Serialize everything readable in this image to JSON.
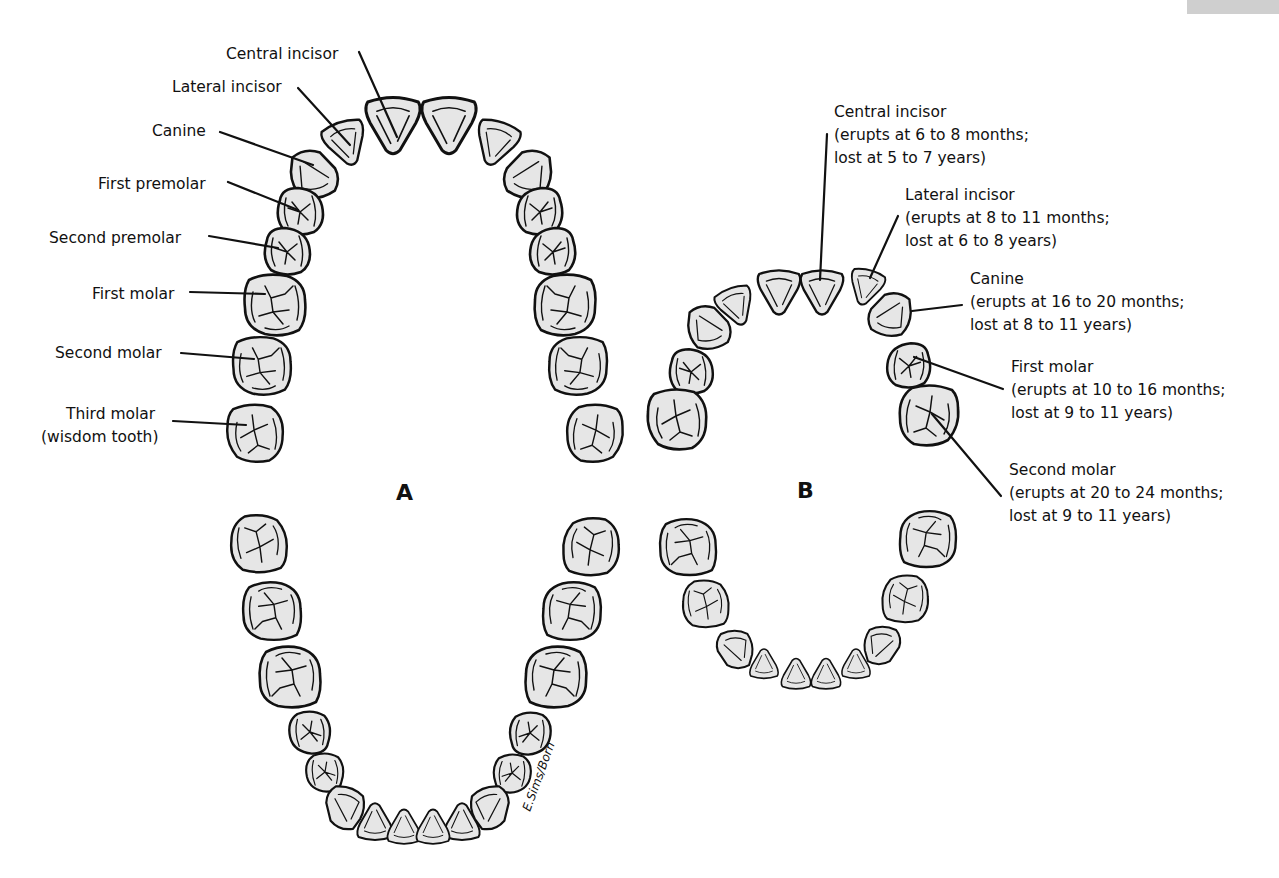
{
  "figure": {
    "panel_a_label": "A",
    "panel_b_label": "B",
    "signature": "E.Sims/Born",
    "colors": {
      "tooth_fill": "#e6e6e6",
      "outline": "#111111",
      "background": "#ffffff"
    }
  },
  "panel_a": {
    "title": "Permanent teeth",
    "labels": [
      {
        "name": "Central incisor"
      },
      {
        "name": "Lateral incisor"
      },
      {
        "name": "Canine"
      },
      {
        "name": "First premolar"
      },
      {
        "name": "Second premolar"
      },
      {
        "name": "First molar"
      },
      {
        "name": "Second molar"
      },
      {
        "name": "Third molar",
        "note": "(wisdom tooth)"
      }
    ]
  },
  "panel_b": {
    "title": "Primary teeth",
    "labels": [
      {
        "name": "Central incisor",
        "erupts": "(erupts at 6 to 8 months;",
        "lost": "lost at 5 to 7 years)"
      },
      {
        "name": "Lateral incisor",
        "erupts": "(erupts at 8 to 11 months;",
        "lost": "lost at 6 to 8 years)"
      },
      {
        "name": "Canine",
        "erupts": "(erupts at 16 to 20 months;",
        "lost": "lost at 8 to 11 years)"
      },
      {
        "name": "First molar",
        "erupts": "(erupts at 10 to 16 months;",
        "lost": "lost at 9 to 11 years)"
      },
      {
        "name": "Second molar",
        "erupts": "(erupts at 20 to 24 months;",
        "lost": "lost at 9 to 11 years)"
      }
    ]
  }
}
